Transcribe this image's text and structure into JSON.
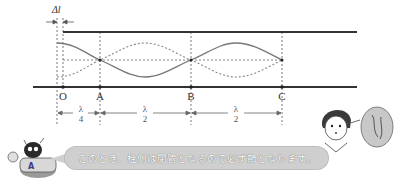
{
  "diagram": {
    "delta_label": "Δl",
    "points": [
      {
        "name": "O",
        "x": 63
      },
      {
        "name": "A",
        "x": 100
      },
      {
        "name": "B",
        "x": 191
      },
      {
        "name": "C",
        "x": 282
      }
    ],
    "segments": [
      {
        "num": "λ",
        "den": "4",
        "x": 81
      },
      {
        "num": "λ",
        "den": "2",
        "x": 145
      },
      {
        "num": "λ",
        "den": "2",
        "x": 236
      }
    ],
    "colors": {
      "tube_wall": "#333333",
      "wave_solid": "#777777",
      "wave_dotted": "#888888",
      "guide": "#555555",
      "bubble": "#cfcfcf"
    }
  },
  "callout": {
    "robot_text": "このとき、栓側は閉管となるので必ず節となります。",
    "girl_thought": "なるほど"
  }
}
